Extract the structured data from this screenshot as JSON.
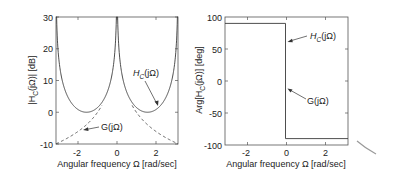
{
  "chart_data": [
    {
      "type": "line",
      "title": "",
      "xlabel": "Angular frequency Ω  [rad/sec]",
      "ylabel": "|H_C(jΩ)| [dB]",
      "xlim": [
        -3.1416,
        3.1416
      ],
      "ylim": [
        -10,
        30
      ],
      "xticks": [
        "-2",
        "0",
        "2"
      ],
      "yticks": [
        "-10",
        "0",
        "10",
        "20",
        "30"
      ],
      "grid": false,
      "series": [
        {
          "name": "H_C(jΩ)",
          "style": "solid",
          "formula": "20*log10(1/|sin(Ω)|), clipped at 30 dB",
          "x": [
            -3.14,
            -3.0,
            -2.5,
            -2.0,
            -1.57,
            -1.0,
            -0.5,
            -0.2,
            -0.1,
            0.0,
            0.1,
            0.2,
            0.5,
            1.0,
            1.57,
            2.0,
            2.5,
            3.0,
            3.14
          ],
          "y": [
            30,
            16.9,
            4.4,
            0.8,
            0.0,
            1.5,
            6.4,
            14.0,
            20.0,
            30,
            20.0,
            14.0,
            6.4,
            1.5,
            0.0,
            0.8,
            4.4,
            16.9,
            30
          ]
        },
        {
          "name": "G(jΩ)",
          "style": "dashed",
          "formula": "20*log10(1/|Ω|)",
          "x": [
            -3.14,
            -2.5,
            -2.0,
            -1.5,
            -1.0,
            -0.8,
            0.8,
            1.0,
            1.5,
            2.0,
            2.5,
            3.14
          ],
          "y": [
            -9.9,
            -8.0,
            -6.0,
            -3.5,
            0.0,
            1.9,
            1.9,
            0.0,
            -3.5,
            -6.0,
            -8.0,
            -9.9
          ]
        }
      ],
      "annotations": [
        {
          "text": "H_C(jΩ)",
          "arrow_to": [
            1.9,
            2.0
          ]
        },
        {
          "text": "G(jΩ)",
          "arrow_to": [
            -1.6,
            -4.5
          ]
        }
      ]
    },
    {
      "type": "line",
      "title": "",
      "xlabel": "Angular frequency Ω  [rad/sec]",
      "ylabel": "Arg[H_C(jΩ)] [deg]",
      "xlim": [
        -3.1416,
        3.1416
      ],
      "ylim": [
        -100,
        100
      ],
      "xticks": [
        "-2",
        "0",
        "2"
      ],
      "yticks": [
        "-100",
        "-50",
        "0",
        "50",
        "100"
      ],
      "grid": false,
      "series": [
        {
          "name": "H_C(jΩ) / G(jΩ)",
          "style": "solid",
          "x": [
            -3.14,
            0,
            0,
            3.14
          ],
          "y": [
            90,
            90,
            -90,
            -90
          ]
        }
      ],
      "annotations": [
        {
          "text": "H_C(jΩ)",
          "arrow_to": [
            0.0,
            60
          ]
        },
        {
          "text": "G(jΩ)",
          "arrow_to": [
            0.0,
            -15
          ]
        }
      ]
    }
  ],
  "left": {
    "yticks": [
      "30",
      "20",
      "10",
      "0",
      "-10"
    ],
    "xticks": [
      "-2",
      "0",
      "2"
    ],
    "ylabel_main": "|H",
    "ylabel_sub": "C",
    "ylabel_rest": "(jΩ)| [dB]",
    "xlabel": "Angular frequency Ω  [rad/sec]",
    "anno_h_main": "H",
    "anno_h_sub": "C",
    "anno_h_rest": "(jΩ)",
    "anno_g": "G(jΩ)"
  },
  "right": {
    "yticks": [
      "100",
      "50",
      "0",
      "-50",
      "-100"
    ],
    "xticks": [
      "-2",
      "0",
      "2"
    ],
    "ylabel_main": "Arg[H",
    "ylabel_sub": "C",
    "ylabel_rest": "(jΩ)] [deg]",
    "xlabel": "Angular frequency Ω  [rad/sec]",
    "anno_h_main": "H",
    "anno_h_sub": "C",
    "anno_h_rest": "(jΩ)",
    "anno_g": "G(jΩ)"
  },
  "colors": {
    "line": "#3a3a3a",
    "frame": "#555555",
    "text": "#222222"
  }
}
